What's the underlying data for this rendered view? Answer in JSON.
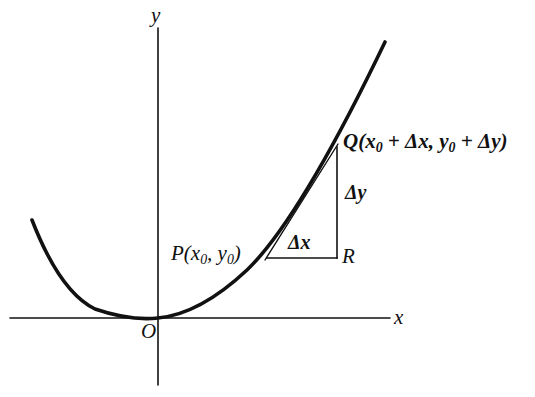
{
  "figure": {
    "background_color": "#ffffff",
    "ink_color": "#111111",
    "width": 535,
    "height": 397
  },
  "axes": {
    "x_axis_label": "x",
    "y_axis_label": "y",
    "origin_label": "O",
    "x_axis": {
      "x1": 10,
      "y1": 318,
      "x2": 390,
      "y2": 318
    },
    "y_axis": {
      "x1": 158,
      "y1": 28,
      "x2": 158,
      "y2": 385
    }
  },
  "curve": {
    "name": "parabola",
    "description": "Upward-opening parabola with vertex at the origin, tangent to the x-axis",
    "vertex": {
      "x": 158,
      "y": 318
    },
    "left_end": {
      "x": 32,
      "y": 220
    },
    "right_end": {
      "x": 385,
      "y": 42
    },
    "stroke_width": 3.6
  },
  "points": {
    "P": {
      "label": "P(x",
      "sub1": "0",
      "mid": ", y",
      "sub2": "0",
      "close": ")",
      "x": 267,
      "y": 258
    },
    "Q": {
      "label_prefix": "Q(x",
      "sub1": "0",
      "plus1": " + Δx, y",
      "sub2": "0",
      "plus2": " + Δy",
      "close": ")",
      "x": 337,
      "y": 146
    },
    "R": {
      "label": "R",
      "x": 337,
      "y": 258
    }
  },
  "segments": {
    "secant_PQ": {
      "x1": 267,
      "y1": 258,
      "x2": 337,
      "y2": 146,
      "stroke_width": 1.3
    },
    "horizontal_PR": {
      "x1": 267,
      "y1": 258,
      "x2": 337,
      "y2": 258,
      "stroke_width": 1.5
    },
    "vertical_RQ": {
      "x1": 337,
      "y1": 258,
      "x2": 337,
      "y2": 147,
      "stroke_width": 1.5
    }
  },
  "annotations": {
    "delta_x": "Δx",
    "delta_y": "Δy"
  }
}
